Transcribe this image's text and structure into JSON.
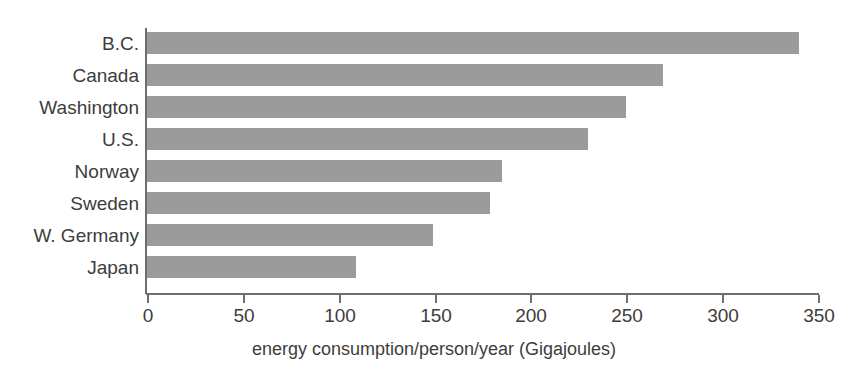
{
  "top_sliver": {
    "text": ""
  },
  "chart_data": {
    "type": "bar",
    "orientation": "horizontal",
    "title": "",
    "xlabel": "energy consumption/person/year (Gigajoules)",
    "ylabel": "",
    "categories": [
      "B.C.",
      "Canada",
      "Washington",
      "U.S.",
      "Norway",
      "Sweden",
      "W. Germany",
      "Japan"
    ],
    "values": [
      340,
      269,
      250,
      230,
      185,
      179,
      149,
      109
    ],
    "xlim": [
      0,
      350
    ],
    "xticks": [
      0,
      50,
      100,
      150,
      200,
      250,
      300,
      350
    ],
    "xtick_labels": [
      "0",
      "50",
      "100",
      "150",
      "200",
      "250",
      "300",
      "350"
    ],
    "grid": false,
    "legend": null,
    "bar_color": "#9b9b9b",
    "axis_color": "#6e6e6e",
    "text_color": "#3d3d3d"
  }
}
